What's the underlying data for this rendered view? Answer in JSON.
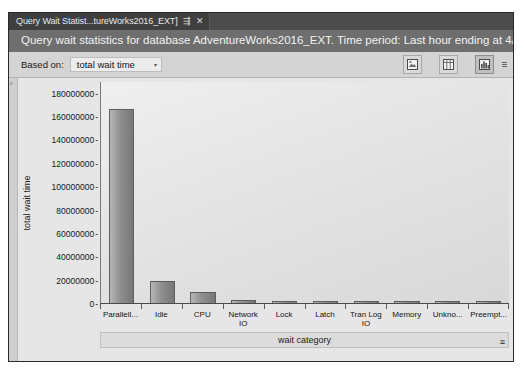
{
  "tab": {
    "label": "Query Wait Statist...tureWorks2016_EXT]",
    "pin_icon": "pin-icon",
    "close_icon": "close-icon",
    "pin_glyph": "⇶",
    "close_glyph": "✕"
  },
  "report": {
    "title": "Query wait statistics for database AdventureWorks2016_EXT. Time period: Last hour ending at 4/21,"
  },
  "toolbar": {
    "based_on_label": "Based on:",
    "based_on_value": "total wait time",
    "caret_glyph": "▾",
    "buttons": [
      {
        "name": "export-image-button",
        "title": "Export"
      },
      {
        "name": "table-view-button",
        "title": "Table view"
      },
      {
        "name": "chart-view-button",
        "title": "Chart view",
        "active": true
      }
    ],
    "overflow_name": "toolbar-overflow-button"
  },
  "chart_data": {
    "type": "bar",
    "title": "",
    "xlabel": "wait category",
    "ylabel": "total wait time",
    "categories": [
      "Parallell...",
      "Idle",
      "CPU",
      "Network IO",
      "Lock",
      "Latch",
      "Tran Log IO",
      "Memory",
      "Unkno...",
      "Preempt..."
    ],
    "values": [
      166000000,
      19000000,
      9000000,
      2500000,
      1200000,
      400000,
      200000,
      150000,
      100000,
      80000
    ],
    "ylim": [
      0,
      190000000
    ],
    "yticks": [
      "180000000",
      "160000000",
      "140000000",
      "120000000",
      "100000000",
      "80000000",
      "60000000",
      "40000000",
      "20000000",
      "0"
    ],
    "ytick_values": [
      180000000,
      160000000,
      140000000,
      120000000,
      100000000,
      80000000,
      60000000,
      40000000,
      20000000,
      0
    ],
    "grid": false,
    "legend": "none",
    "bar_color": "#8f8f8f",
    "plot_background": "#e4e4e4"
  }
}
